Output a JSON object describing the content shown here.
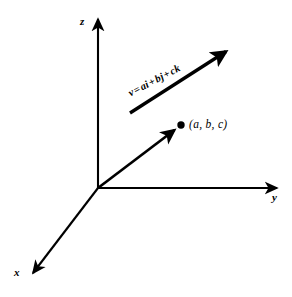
{
  "figure": {
    "background_color": "#ffffff",
    "stroke_color": "#000000",
    "width": 292,
    "height": 297
  },
  "axes": {
    "x_label": "x",
    "y_label": "y",
    "z_label": "z",
    "origin": {
      "x": 98,
      "y": 188
    },
    "x_tip": {
      "x": 29,
      "y": 277
    },
    "y_tip": {
      "x": 281,
      "y": 188
    },
    "z_tip": {
      "x": 98,
      "y": 15
    }
  },
  "point": {
    "label": "(a, b, c)",
    "dot_x": 181,
    "dot_y": 125,
    "dot_radius": 3.6
  },
  "vector_equation": {
    "vector_name": "v",
    "equals": "=",
    "term_1_scalar": "a",
    "term_1_unit": "i",
    "plus_1": "+",
    "term_2_scalar": "b",
    "term_2_unit": "j",
    "plus_2": "+",
    "term_3_scalar": "c",
    "term_3_unit": "k",
    "full_text": "v = ai + bj + ck",
    "rotation_degrees": -27.5
  },
  "vectors": [
    {
      "name": "position-vector",
      "from": {
        "x": 98,
        "y": 188
      },
      "to": {
        "x": 181,
        "y": 125
      },
      "stroke_width": 2.6,
      "has_arrowhead": true
    },
    {
      "name": "free-vector",
      "from": {
        "x": 130,
        "y": 113
      },
      "to": {
        "x": 233,
        "y": 47
      },
      "stroke_width": 3.2,
      "has_arrowhead": true
    }
  ]
}
